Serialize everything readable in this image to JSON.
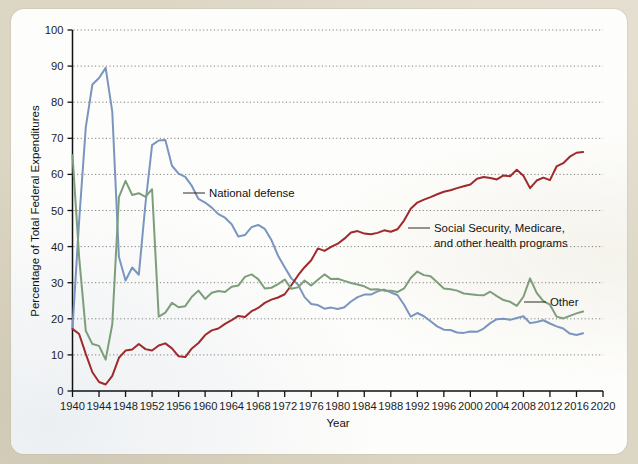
{
  "figure": {
    "panel_background": "#fdfdfb",
    "outer_background": "#dcd6c5"
  },
  "chart_data": {
    "type": "line",
    "title": "",
    "xlabel": "Year",
    "ylabel": "Percentage of Total Federal Expenditures",
    "xlim": [
      1940,
      2020
    ],
    "ylim": [
      0,
      100
    ],
    "grid": true,
    "legend_position": "inline-annotations",
    "xticks": [
      1940,
      1944,
      1948,
      1952,
      1956,
      1960,
      1964,
      1968,
      1972,
      1976,
      1980,
      1984,
      1988,
      1992,
      1996,
      2000,
      2004,
      2008,
      2012,
      2016,
      2020
    ],
    "yticks": [
      0,
      10,
      20,
      30,
      40,
      50,
      60,
      70,
      80,
      90,
      100
    ],
    "x": [
      1940,
      1941,
      1942,
      1943,
      1944,
      1945,
      1946,
      1947,
      1948,
      1949,
      1950,
      1951,
      1952,
      1953,
      1954,
      1955,
      1956,
      1957,
      1958,
      1959,
      1960,
      1961,
      1962,
      1963,
      1964,
      1965,
      1966,
      1967,
      1968,
      1969,
      1970,
      1971,
      1972,
      1973,
      1974,
      1975,
      1976,
      1977,
      1978,
      1979,
      1980,
      1981,
      1982,
      1983,
      1984,
      1985,
      1986,
      1987,
      1988,
      1989,
      1990,
      1991,
      1992,
      1993,
      1994,
      1995,
      1996,
      1997,
      1998,
      1999,
      2000,
      2001,
      2002,
      2003,
      2004,
      2005,
      2006,
      2007,
      2008,
      2009,
      2010,
      2011,
      2012,
      2013,
      2014,
      2015,
      2016,
      2017
    ],
    "series": [
      {
        "name": "National defense",
        "color": "#7a95c0",
        "values": [
          17.5,
          47.1,
          73.0,
          84.9,
          86.7,
          89.5,
          77.3,
          37.1,
          30.6,
          34.2,
          32.2,
          51.8,
          68.1,
          69.4,
          69.5,
          62.4,
          60.2,
          59.3,
          56.8,
          53.2,
          52.2,
          50.8,
          49.0,
          48.0,
          46.2,
          42.8,
          43.2,
          45.4,
          46.0,
          44.9,
          41.8,
          37.5,
          34.3,
          31.2,
          29.5,
          26.0,
          24.1,
          23.8,
          22.8,
          23.1,
          22.7,
          23.2,
          24.8,
          26.0,
          26.7,
          26.7,
          27.6,
          28.1,
          27.3,
          26.6,
          23.9,
          20.6,
          21.6,
          20.7,
          19.3,
          17.9,
          17.0,
          16.9,
          16.2,
          16.1,
          16.5,
          16.4,
          17.3,
          18.8,
          19.9,
          20.0,
          19.7,
          20.2,
          20.7,
          18.8,
          19.1,
          19.6,
          18.7,
          17.9,
          17.3,
          15.9,
          15.5,
          16.0
        ]
      },
      {
        "name": "Social Security, Medicare, and other health programs",
        "color": "#9e2a2b",
        "values": [
          17.2,
          15.8,
          10.3,
          5.2,
          2.5,
          1.8,
          4.2,
          9.2,
          11.2,
          11.5,
          13.0,
          11.6,
          11.2,
          12.6,
          13.2,
          11.8,
          9.6,
          9.4,
          11.8,
          13.3,
          15.5,
          16.8,
          17.3,
          18.6,
          19.6,
          20.8,
          20.5,
          22.1,
          23.0,
          24.4,
          25.3,
          25.9,
          26.8,
          29.3,
          32.0,
          34.3,
          36.2,
          39.5,
          38.8,
          39.9,
          40.8,
          42.2,
          43.9,
          44.3,
          43.6,
          43.4,
          43.8,
          44.5,
          44.1,
          44.8,
          47.2,
          50.5,
          52.2,
          53.0,
          53.7,
          54.5,
          55.2,
          55.6,
          56.2,
          56.7,
          57.2,
          58.8,
          59.3,
          59.0,
          58.6,
          59.7,
          59.5,
          61.3,
          59.6,
          56.2,
          58.3,
          59.1,
          58.4,
          62.2,
          63.1,
          64.9,
          66.0,
          66.2
        ]
      },
      {
        "name": "Other",
        "color": "#7d9e7a",
        "values": [
          65.3,
          37.1,
          16.7,
          13.0,
          12.5,
          8.7,
          18.5,
          53.7,
          58.2,
          54.3,
          54.8,
          53.8,
          55.9,
          20.6,
          21.7,
          24.4,
          23.2,
          23.5,
          26.1,
          27.8,
          25.5,
          27.2,
          27.7,
          27.4,
          28.9,
          29.2,
          31.6,
          32.3,
          31.0,
          28.4,
          28.6,
          29.6,
          30.9,
          28.3,
          28.7,
          30.6,
          29.2,
          30.8,
          32.3,
          31.0,
          31.1,
          30.5,
          29.9,
          29.5,
          29.0,
          28.1,
          28.2,
          27.8,
          27.8,
          27.4,
          28.4,
          31.3,
          33.1,
          32.1,
          31.8,
          30.1,
          28.4,
          28.2,
          27.8,
          27.0,
          26.8,
          26.6,
          26.5,
          27.5,
          26.3,
          25.2,
          24.7,
          23.6,
          26.1,
          31.2,
          27.2,
          24.9,
          23.9,
          20.6,
          20.1,
          20.8,
          21.5,
          22.0
        ]
      }
    ],
    "annotations": [
      {
        "label": "National defense",
        "series": "National defense"
      },
      {
        "label": "Social Security, Medicare,",
        "series": "Social Security, Medicare, and other health programs"
      },
      {
        "label": "and other health programs",
        "series": "Social Security, Medicare, and other health programs"
      },
      {
        "label": "Other",
        "series": "Other"
      }
    ]
  }
}
